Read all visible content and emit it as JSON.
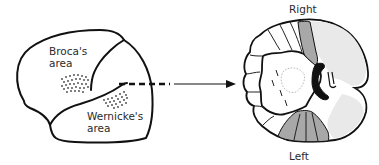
{
  "diagram": {
    "lateral_view": {
      "labels": {
        "broca_line1": "Broca's",
        "broca_line2": "area",
        "wernicke_line1": "Wernicke's",
        "wernicke_line2": "area"
      }
    },
    "coronal_section": {
      "labels": {
        "top": "Right",
        "bottom": "Left"
      }
    },
    "colors": {
      "outline": "#111111",
      "highlight_gray": "#a8a8a8",
      "ventricle": "#111111",
      "stipple": "#666666",
      "background": "#ffffff"
    }
  }
}
